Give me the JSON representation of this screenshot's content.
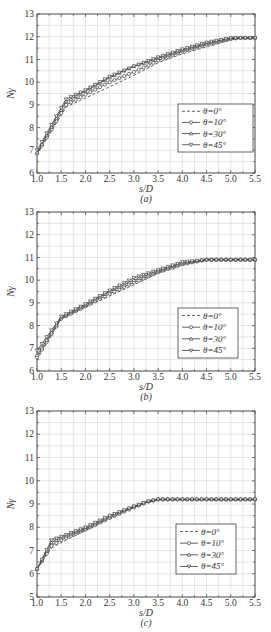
{
  "chart_data": [
    {
      "type": "line",
      "panel": "(a)",
      "title": "",
      "xlabel": "s/D",
      "ylabel": "Nγ",
      "caption": "(a)",
      "xlim": [
        1.0,
        5.5
      ],
      "ylim": [
        6,
        13
      ],
      "xticks": [
        "1.0",
        "1.5",
        "2.0",
        "2.5",
        "3.0",
        "3.5",
        "4.0",
        "4.5",
        "5.0",
        "5.5"
      ],
      "yticks": [
        "6",
        "7",
        "8",
        "9",
        "10",
        "11",
        "12",
        "13"
      ],
      "grid": true,
      "legend_position": "lower right",
      "x": [
        1.0,
        1.6,
        2.0,
        2.5,
        3.0,
        3.5,
        4.0,
        4.5,
        5.0,
        5.2,
        5.5
      ],
      "series": [
        {
          "name": "θ=0°",
          "style": "dashed",
          "marker": "none",
          "values": [
            6.8,
            8.9,
            9.3,
            9.8,
            10.3,
            10.85,
            11.25,
            11.55,
            11.85,
            11.95,
            11.95
          ]
        },
        {
          "name": "θ=10°",
          "style": "solid",
          "marker": "circle",
          "values": [
            6.85,
            9.0,
            9.45,
            10.0,
            10.45,
            10.95,
            11.35,
            11.65,
            11.9,
            11.95,
            11.95
          ]
        },
        {
          "name": "θ=30°",
          "style": "solid",
          "marker": "triangle-up",
          "values": [
            6.9,
            9.15,
            9.6,
            10.2,
            10.7,
            11.05,
            11.4,
            11.7,
            11.95,
            11.95,
            11.95
          ]
        },
        {
          "name": "θ=45°",
          "style": "solid",
          "marker": "triangle-down",
          "values": [
            7.0,
            9.25,
            9.65,
            10.25,
            10.7,
            11.1,
            11.45,
            11.75,
            11.95,
            11.95,
            11.95
          ]
        }
      ]
    },
    {
      "type": "line",
      "panel": "(b)",
      "title": "",
      "xlabel": "s/D",
      "ylabel": "Nγ",
      "caption": "(b)",
      "xlim": [
        1.0,
        5.5
      ],
      "ylim": [
        6,
        13
      ],
      "xticks": [
        "1.0",
        "1.5",
        "2.0",
        "2.5",
        "3.0",
        "3.5",
        "4.0",
        "4.5",
        "5.0",
        "5.5"
      ],
      "yticks": [
        "6",
        "7",
        "8",
        "9",
        "10",
        "11",
        "12",
        "13"
      ],
      "grid": true,
      "legend_position": "lower right",
      "x": [
        1.0,
        1.5,
        2.0,
        2.5,
        3.0,
        3.5,
        4.0,
        4.5,
        5.0,
        5.5
      ],
      "series": [
        {
          "name": "θ=0°",
          "style": "dashed",
          "marker": "none",
          "values": [
            6.5,
            8.3,
            8.8,
            9.3,
            9.8,
            10.3,
            10.65,
            10.9,
            10.9,
            10.9
          ]
        },
        {
          "name": "θ=10°",
          "style": "solid",
          "marker": "circle",
          "values": [
            6.6,
            8.3,
            8.85,
            9.4,
            9.9,
            10.35,
            10.7,
            10.9,
            10.9,
            10.9
          ]
        },
        {
          "name": "θ=30°",
          "style": "solid",
          "marker": "triangle-up",
          "values": [
            6.7,
            8.35,
            8.9,
            9.5,
            10.0,
            10.4,
            10.75,
            10.9,
            10.9,
            10.9
          ]
        },
        {
          "name": "θ=45°",
          "style": "solid",
          "marker": "triangle-down",
          "values": [
            6.9,
            8.4,
            8.95,
            9.55,
            10.1,
            10.45,
            10.8,
            10.9,
            10.9,
            10.9
          ]
        }
      ]
    },
    {
      "type": "line",
      "panel": "(c)",
      "title": "",
      "xlabel": "s/D",
      "ylabel": "Nγ",
      "caption": "(c)",
      "xlim": [
        1.0,
        5.5
      ],
      "ylim": [
        5,
        13
      ],
      "xticks": [
        "1.0",
        "1.5",
        "2.0",
        "2.5",
        "3.0",
        "3.5",
        "4.0",
        "4.5",
        "5.0",
        "5.5"
      ],
      "yticks": [
        "5",
        "6",
        "7",
        "8",
        "9",
        "10",
        "11",
        "12",
        "13"
      ],
      "grid": true,
      "legend_position": "lower right",
      "x": [
        1.0,
        1.3,
        1.5,
        2.0,
        2.5,
        3.0,
        3.3,
        3.5,
        4.0,
        4.5,
        5.0,
        5.5
      ],
      "series": [
        {
          "name": "θ=0°",
          "style": "dashed",
          "marker": "none",
          "values": [
            6.2,
            7.1,
            7.35,
            7.85,
            8.35,
            8.85,
            9.1,
            9.2,
            9.2,
            9.2,
            9.2,
            9.2
          ]
        },
        {
          "name": "θ=10°",
          "style": "solid",
          "marker": "circle",
          "values": [
            6.2,
            7.2,
            7.45,
            7.9,
            8.4,
            8.85,
            9.1,
            9.2,
            9.2,
            9.2,
            9.2,
            9.2
          ]
        },
        {
          "name": "θ=30°",
          "style": "solid",
          "marker": "triangle-up",
          "values": [
            6.2,
            7.35,
            7.55,
            7.95,
            8.45,
            8.9,
            9.12,
            9.2,
            9.2,
            9.2,
            9.2,
            9.2
          ]
        },
        {
          "name": "θ=45°",
          "style": "solid",
          "marker": "triangle-down",
          "values": [
            6.2,
            7.45,
            7.6,
            8.0,
            8.5,
            8.9,
            9.12,
            9.2,
            9.2,
            9.2,
            9.2,
            9.2
          ]
        }
      ]
    }
  ],
  "layout": {
    "panels": [
      {
        "left": 37,
        "right": 255,
        "top": 14,
        "bottom": 173,
        "legend": {
          "x": 178,
          "y": 104,
          "w": 75,
          "h": 48
        }
      },
      {
        "left": 37,
        "right": 255,
        "top": 212,
        "bottom": 371,
        "legend": {
          "x": 178,
          "y": 308,
          "w": 60,
          "h": 50
        }
      },
      {
        "left": 37,
        "right": 255,
        "top": 411,
        "bottom": 597,
        "legend": {
          "x": 176,
          "y": 524,
          "w": 60,
          "h": 50
        }
      }
    ]
  }
}
